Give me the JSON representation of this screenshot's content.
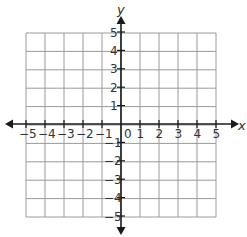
{
  "diagram": {
    "type": "coordinate-plane",
    "x_axis_label": "x",
    "y_axis_label": "y",
    "x_range": [
      -5,
      5
    ],
    "y_range": [
      -5,
      5
    ],
    "origin_label": "0",
    "x_ticks": [
      "-5",
      "-4",
      "-3",
      "-2",
      "-1",
      "1",
      "2",
      "3",
      "4",
      "5"
    ],
    "y_ticks": [
      "5",
      "4",
      "3",
      "2",
      "1",
      "-1",
      "-2",
      "-3",
      "-4",
      "-5"
    ],
    "grid": true,
    "colors": {
      "grid": "#9a9a9a",
      "axis": "#1a1a1a",
      "text": "#333333"
    }
  }
}
